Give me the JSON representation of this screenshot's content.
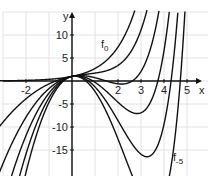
{
  "chart_data": {
    "type": "line",
    "title": "",
    "xlabel": "x",
    "ylabel": "y",
    "xlim": [
      -3,
      5.6
    ],
    "ylim": [
      -20,
      15.5
    ],
    "grid": true,
    "x_ticks": [
      -2,
      2,
      3,
      4,
      5
    ],
    "x_tick_labels": [
      "-2",
      "2",
      "3",
      "4",
      "5"
    ],
    "y_ticks": [
      10,
      5,
      -5,
      -10,
      -15
    ],
    "y_tick_labels": [
      "10",
      "5",
      "-5",
      "-10",
      "-15"
    ],
    "function_family": "f_a(x) = e^x + a·x^2",
    "series": [
      {
        "name": "f0",
        "a": 0,
        "label_sub": "0",
        "label_at": [
          2.0,
          7.5
        ]
      },
      {
        "name": "f-1",
        "a": -1
      },
      {
        "name": "f-2",
        "a": -2,
        "minimum": [
          2.15,
          -0.6
        ]
      },
      {
        "name": "f-3",
        "a": -3,
        "minimum": [
          2.83,
          -7.1
        ]
      },
      {
        "name": "f-4",
        "a": -4,
        "minimum": [
          3.26,
          -16.5
        ]
      },
      {
        "name": "f-5",
        "a": -5,
        "label_sub": "-5",
        "label_at": [
          4.6,
          -17.5
        ]
      }
    ],
    "legend": "inline labels on curves f0 and f-5"
  },
  "labels": {
    "x_axis": "x",
    "y_axis": "y",
    "f0_main": "f",
    "f0_sub": "0",
    "f5_main": "f",
    "f5_sub": "-5"
  }
}
